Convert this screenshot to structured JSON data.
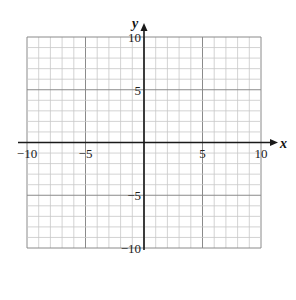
{
  "chart_data": {
    "type": "scatter",
    "title": "",
    "xlabel": "x",
    "ylabel": "y",
    "xlim": [
      -10,
      10
    ],
    "ylim": [
      -10,
      10
    ],
    "grid": true,
    "grid_step": 1,
    "major_grid_step": 5,
    "x_ticks": [
      -10,
      -5,
      5,
      10
    ],
    "x_tick_labels": [
      "−10",
      "−5",
      "5",
      "10"
    ],
    "y_ticks": [
      10,
      5,
      -5,
      -10
    ],
    "y_tick_labels": [
      "10",
      "5",
      "−5",
      "−10"
    ],
    "series": [],
    "legend": null
  },
  "colors": {
    "minor_grid": "#c8c8c8",
    "major_grid": "#8a8a8a",
    "axis": "#1a1a1a",
    "background": "#ffffff"
  }
}
